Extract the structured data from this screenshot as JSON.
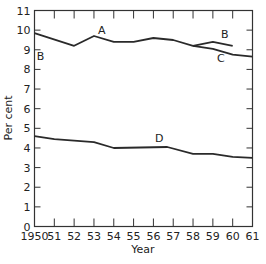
{
  "chart_data": {
    "type": "line",
    "title": "",
    "xlabel": "Year",
    "ylabel": "Per cent",
    "xlim": [
      1950,
      1961
    ],
    "ylim": [
      0,
      11
    ],
    "grid": false,
    "legend": "none (inline curve labels A, B, C, D)",
    "x_tick_labels": [
      "1950",
      "51",
      "52",
      "53",
      "54",
      "55",
      "56",
      "57",
      "58",
      "59",
      "60",
      "61"
    ],
    "y_tick_labels": [
      "0",
      "1",
      "2",
      "3",
      "4",
      "5",
      "6",
      "7",
      "8",
      "9",
      "10",
      "11"
    ],
    "series": [
      {
        "name": "A/C",
        "x": [
          1950,
          1952,
          1953,
          1954,
          1955,
          1956,
          1957,
          1958,
          1959,
          1960,
          1961
        ],
        "values": [
          9.85,
          9.2,
          9.7,
          9.4,
          9.4,
          9.6,
          9.5,
          9.2,
          9.05,
          8.75,
          8.65
        ]
      },
      {
        "name": "B",
        "x": [
          1958,
          1959,
          1960
        ],
        "values": [
          9.2,
          9.4,
          9.2
        ]
      },
      {
        "name": "D",
        "x": [
          1950,
          1951,
          1953,
          1954,
          1956.7,
          1958,
          1959,
          1960,
          1961
        ],
        "values": [
          4.6,
          4.45,
          4.3,
          4.0,
          4.05,
          3.7,
          3.7,
          3.55,
          3.5
        ]
      }
    ],
    "annotations": [
      {
        "text": "A",
        "x": 1953.4,
        "y": 9.8
      },
      {
        "text": "B",
        "x": 1950.3,
        "y": 8.5
      },
      {
        "text": "B",
        "x": 1959.6,
        "y": 9.6
      },
      {
        "text": "C",
        "x": 1959.4,
        "y": 8.4
      },
      {
        "text": "D",
        "x": 1956.3,
        "y": 4.3
      }
    ]
  }
}
